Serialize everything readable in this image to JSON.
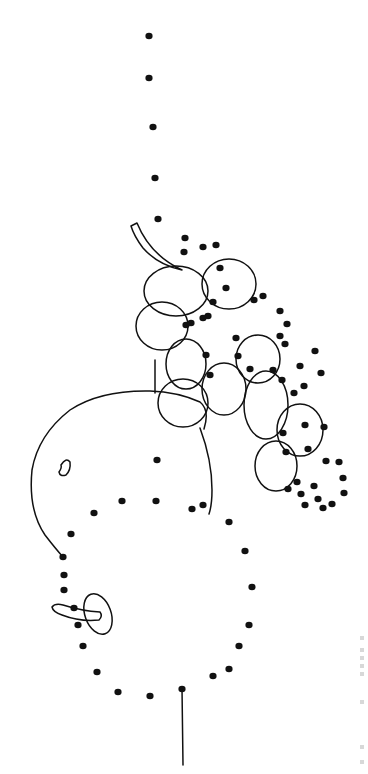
{
  "page": {
    "type": "connect-the-dots coloring page",
    "orientation": "rotated 90 degrees",
    "background": "#ffffff",
    "ink": "#111111"
  },
  "caption": {
    "text_legible": false,
    "marks_y": [
      636,
      648,
      656,
      664,
      672,
      700,
      745,
      760
    ]
  },
  "dots": [
    [
      149,
      36
    ],
    [
      149,
      78
    ],
    [
      153,
      127
    ],
    [
      155,
      178
    ],
    [
      158,
      219
    ],
    [
      185,
      238
    ],
    [
      203,
      247
    ],
    [
      216,
      245
    ],
    [
      220,
      268
    ],
    [
      184,
      252
    ],
    [
      226,
      288
    ],
    [
      254,
      300
    ],
    [
      263,
      296
    ],
    [
      280,
      311
    ],
    [
      287,
      324
    ],
    [
      285,
      344
    ],
    [
      280,
      336
    ],
    [
      213,
      302
    ],
    [
      208,
      316
    ],
    [
      191,
      323
    ],
    [
      203,
      318
    ],
    [
      186,
      325
    ],
    [
      206,
      355
    ],
    [
      210,
      375
    ],
    [
      238,
      356
    ],
    [
      236,
      338
    ],
    [
      250,
      369
    ],
    [
      273,
      370
    ],
    [
      282,
      380
    ],
    [
      294,
      393
    ],
    [
      300,
      366
    ],
    [
      304,
      386
    ],
    [
      315,
      351
    ],
    [
      321,
      373
    ],
    [
      324,
      427
    ],
    [
      308,
      449
    ],
    [
      305,
      425
    ],
    [
      283,
      433
    ],
    [
      286,
      452
    ],
    [
      288,
      489
    ],
    [
      301,
      494
    ],
    [
      314,
      486
    ],
    [
      326,
      461
    ],
    [
      339,
      462
    ],
    [
      343,
      478
    ],
    [
      344,
      493
    ],
    [
      332,
      504
    ],
    [
      323,
      508
    ],
    [
      318,
      499
    ],
    [
      305,
      505
    ],
    [
      297,
      482
    ],
    [
      157,
      460
    ],
    [
      122,
      501
    ],
    [
      156,
      501
    ],
    [
      192,
      509
    ],
    [
      94,
      513
    ],
    [
      71,
      534
    ],
    [
      63,
      557
    ],
    [
      64,
      575
    ],
    [
      64,
      590
    ],
    [
      74,
      608
    ],
    [
      78,
      625
    ],
    [
      83,
      646
    ],
    [
      97,
      672
    ],
    [
      118,
      692
    ],
    [
      150,
      696
    ],
    [
      182,
      689
    ],
    [
      213,
      676
    ],
    [
      229,
      669
    ],
    [
      239,
      646
    ],
    [
      249,
      625
    ],
    [
      252,
      587
    ],
    [
      245,
      551
    ],
    [
      229,
      522
    ],
    [
      203,
      505
    ]
  ],
  "shapes": {
    "grapes": [
      {
        "cx": 176,
        "cy": 291,
        "rx": 32,
        "ry": 25
      },
      {
        "cx": 229,
        "cy": 284,
        "rx": 27,
        "ry": 25
      },
      {
        "cx": 162,
        "cy": 326,
        "rx": 26,
        "ry": 24
      },
      {
        "cx": 186,
        "cy": 364,
        "rx": 20,
        "ry": 25
      },
      {
        "cx": 224,
        "cy": 389,
        "rx": 22,
        "ry": 26
      },
      {
        "cx": 258,
        "cy": 359,
        "rx": 22,
        "ry": 24
      },
      {
        "cx": 183,
        "cy": 403,
        "rx": 25,
        "ry": 24
      },
      {
        "cx": 266,
        "cy": 405,
        "rx": 22,
        "ry": 34
      },
      {
        "cx": 300,
        "cy": 430,
        "rx": 23,
        "ry": 26
      },
      {
        "cx": 276,
        "cy": 466,
        "rx": 21,
        "ry": 25
      }
    ],
    "stem_path": "M131 226 L137 223 Q150 255 182 270 Q158 265 143 248 Q134 236 131 226 Z",
    "fruit_outline": "M204 429 Q210 410 200 402 Q178 392 150 391 Q100 390 70 410 Q38 435 32 470 Q28 510 45 535 Q55 548 63 557",
    "fruit_right": "M200 428 Q212 460 212 490 Q212 505 209 514",
    "fruit_highlight": "M61 465 Q66 457 70 462 Q71 470 66 475 Q60 477 59 472 Q62 468 61 465 Z",
    "leaf_path": "M52 607 Q55 603 63 605 Q82 611 100 612 Q103 616 99 620 Q80 622 62 615 Q53 612 52 607 Z",
    "leaf_oval": {
      "cx": 98,
      "cy": 614,
      "rx": 13,
      "ry": 21
    },
    "bottom_stem": "M182 688 L183 765",
    "grape_stem_link": "M155 360 L155 393"
  }
}
